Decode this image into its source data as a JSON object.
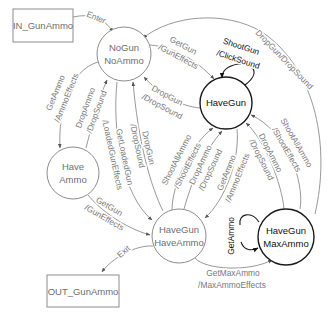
{
  "colors": {
    "line": "#8c8c8c",
    "text": "#777777",
    "strong": "#111111",
    "background": "#ffffff"
  },
  "nodes": {
    "in_box": {
      "label": "IN_GunAmmo"
    },
    "out_box": {
      "label": "OUT_GunAmmo"
    },
    "nogun_noammo": {
      "line1": "NoGun",
      "line2": "NoAmmo"
    },
    "havegun": {
      "label": "HaveGun"
    },
    "have_ammo": {
      "line1": "Have",
      "line2": "Ammo"
    },
    "havegun_haveammo": {
      "line1": "HaveGun",
      "line2": "HaveAmmo"
    },
    "havegun_maxammo": {
      "line1": "HaveGun",
      "line2": "MaxAmmo"
    }
  },
  "transitions": {
    "enter": {
      "event": "Enter"
    },
    "nogun_to_haveammo": {
      "event": "GetAmmo",
      "action": "/AmmoEffects"
    },
    "haveammo_to_nogun": {
      "event": "DropAmmo",
      "action": "/DropSound"
    },
    "nogun_to_hgha": {
      "event": "GetLoadedGun",
      "action": "/LoadedGunEffects"
    },
    "hgha_to_nogun": {
      "event": "DropGun",
      "action": "/DropSound"
    },
    "nogun_to_havegun": {
      "event": "GetGun",
      "action": "/GunEffects"
    },
    "havegun_to_nogun": {
      "event": "DropGun",
      "action": "/DropSound"
    },
    "havegun_self": {
      "event": "ShootGun",
      "action": "/ClickSound"
    },
    "maxammo_to_nogun": {
      "label": "DropGun/DropSound"
    },
    "haveammo_to_hgha": {
      "event": "GetGun",
      "action": "/GunEffects"
    },
    "exit": {
      "event": "Exit"
    },
    "hgha_shootall_to_havegun": {
      "event": "ShootAllAmmo",
      "action": "/ShootEffects"
    },
    "hgha_dropammo_to_havegun": {
      "event": "DropAmmo",
      "action": "/DropSound"
    },
    "havegun_to_hgha": {
      "event": "GetAmmo",
      "action": "/AmmoEffects"
    },
    "maxammo_shootall_to_havegun": {
      "event": "ShootAllAmmo",
      "action": "/ShootEffects"
    },
    "maxammo_dropammo_to_havegun": {
      "event": "DropAmmo",
      "action": "/DropSound"
    },
    "maxammo_self": {
      "event": "GetAmmo"
    },
    "hgha_to_maxammo": {
      "event": "GetMaxAmmo",
      "action": "/MaxAmmoEffects"
    }
  }
}
